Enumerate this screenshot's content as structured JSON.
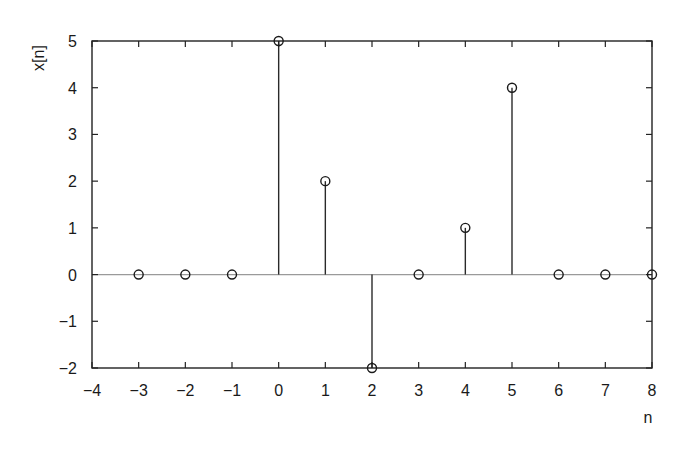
{
  "chart_data": {
    "type": "stem",
    "title": "",
    "xlabel": "n",
    "ylabel": "x[n]",
    "xlim": [
      -4,
      8
    ],
    "ylim": [
      -2,
      5
    ],
    "xticks": [
      -4,
      -3,
      -2,
      -1,
      0,
      1,
      2,
      3,
      4,
      5,
      6,
      7,
      8
    ],
    "yticks": [
      -2,
      -1,
      0,
      1,
      2,
      3,
      4,
      5
    ],
    "xtick_labels": [
      "−4",
      "−3",
      "−2",
      "−1",
      "0",
      "1",
      "2",
      "3",
      "4",
      "5",
      "6",
      "7",
      "8"
    ],
    "ytick_labels": [
      "−2",
      "−1",
      "0",
      "1",
      "2",
      "3",
      "4",
      "5"
    ],
    "grid": false,
    "legend": null,
    "series": [
      {
        "name": "x[n]",
        "marker": "open-circle",
        "x": [
          -3,
          -2,
          -1,
          0,
          1,
          2,
          3,
          4,
          5,
          6,
          7,
          8
        ],
        "values": [
          0,
          0,
          0,
          5,
          2,
          -2,
          0,
          1,
          4,
          0,
          0,
          0
        ]
      }
    ],
    "baseline": 0
  },
  "colors": {
    "axis": "#222222",
    "stem": "#2a2a2a",
    "baseline": "#9a9a9a",
    "marker": "#1a1a1a"
  }
}
